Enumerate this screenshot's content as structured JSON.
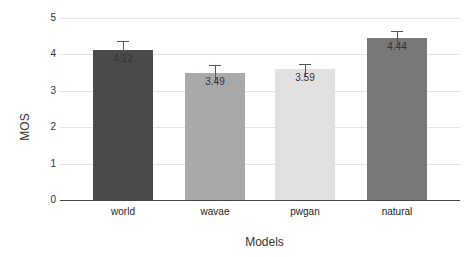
{
  "chart_data": {
    "type": "bar",
    "title": "",
    "xlabel": "Models",
    "ylabel": "MOS",
    "ylim": [
      0,
      5
    ],
    "yticks": [
      0,
      1,
      2,
      3,
      4,
      5
    ],
    "grid": true,
    "categories": [
      "world",
      "wavae",
      "pwgan",
      "natural"
    ],
    "values": [
      4.12,
      3.49,
      3.59,
      4.44
    ],
    "value_labels": [
      "4.12",
      "3.49",
      "3.59",
      "4.44"
    ],
    "error_upper": [
      4.37,
      3.7,
      3.75,
      4.64
    ],
    "colors": [
      "#4a4a4a",
      "#a9a9a9",
      "#e1e1e1",
      "#787878"
    ]
  },
  "labels": {
    "xlabel": "Models",
    "ylabel": "MOS",
    "yticks": [
      "0",
      "1",
      "2",
      "3",
      "4",
      "5"
    ]
  }
}
